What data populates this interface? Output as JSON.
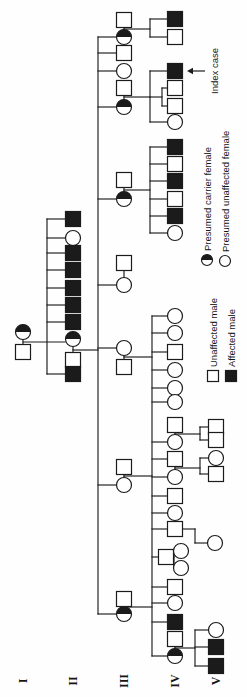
{
  "figure": {
    "type": "pedigree-chart",
    "orientation": "rotated-90-ccw",
    "canvas": {
      "width": 697,
      "height": 247
    },
    "ink_color": "#1b1b1b",
    "background_color": "#fefefe"
  },
  "generation_labels": [
    {
      "label": "I",
      "x": 16,
      "y": 23
    },
    {
      "label": "II",
      "x": 16,
      "y": 73
    },
    {
      "label": "III",
      "x": 16,
      "y": 124
    },
    {
      "label": "IV",
      "x": 16,
      "y": 175
    },
    {
      "label": "V",
      "x": 16,
      "y": 216
    }
  ],
  "legend": {
    "items": [
      {
        "symbol": "square-open",
        "label": "Unaffected male",
        "x": 321,
        "y": 213,
        "label_x": 330
      },
      {
        "symbol": "square-filled",
        "label": "Affected male",
        "x": 321,
        "y": 231,
        "label_x": 330
      },
      {
        "symbol": "circle-half",
        "label": "Presumed carrier female",
        "x": 437,
        "y": 207,
        "label_x": 446
      },
      {
        "symbol": "circle-open",
        "label": "Presumed unaffected female",
        "x": 436,
        "y": 225,
        "label_x": 445
      }
    ]
  },
  "annotations": {
    "index_case": {
      "label": "Index case",
      "arrow_x": 626,
      "arrow_from_y": 205,
      "arrow_to_y": 187,
      "label_x": 626,
      "label_y": 215
    }
  },
  "pedigree": {
    "symbol": {
      "square_size": 15,
      "circle_radius": 7.5,
      "legend_square_size": 11,
      "legend_circle_radius": 5.5
    },
    "individuals": [
      {
        "gen": "I",
        "shape": "square",
        "status": "unaffected",
        "x": 345,
        "y": 23
      },
      {
        "gen": "I",
        "shape": "circle",
        "status": "carrier",
        "x": 365,
        "y": 23
      },
      {
        "gen": "II",
        "shape": "square",
        "status": "affected",
        "x": 478,
        "y": 73
      },
      {
        "gen": "II",
        "shape": "circle",
        "status": "unaffected",
        "x": 459,
        "y": 73
      },
      {
        "gen": "II",
        "shape": "square",
        "status": "affected",
        "x": 444,
        "y": 73
      },
      {
        "gen": "II",
        "shape": "square",
        "status": "affected",
        "x": 427,
        "y": 73
      },
      {
        "gen": "II",
        "shape": "square",
        "status": "affected",
        "x": 409,
        "y": 73
      },
      {
        "gen": "II",
        "shape": "square",
        "status": "affected",
        "x": 392,
        "y": 73
      },
      {
        "gen": "II",
        "shape": "square",
        "status": "affected",
        "x": 375,
        "y": 73
      },
      {
        "gen": "II",
        "shape": "circle",
        "status": "carrier",
        "x": 358,
        "y": 73
      },
      {
        "gen": "II",
        "shape": "square",
        "status": "unaffected",
        "x": 337,
        "y": 73
      },
      {
        "gen": "II",
        "shape": "square",
        "status": "affected",
        "x": 323,
        "y": 73
      },
      {
        "gen": "III",
        "shape": "square",
        "status": "unaffected",
        "x": 677,
        "y": 124
      },
      {
        "gen": "III",
        "shape": "circle",
        "status": "carrier",
        "x": 660,
        "y": 124
      },
      {
        "gen": "III",
        "shape": "square",
        "status": "unaffected",
        "x": 644,
        "y": 124
      },
      {
        "gen": "III",
        "shape": "circle",
        "status": "unaffected",
        "x": 626,
        "y": 124
      },
      {
        "gen": "III",
        "shape": "square",
        "status": "unaffected",
        "x": 609,
        "y": 124
      },
      {
        "gen": "III",
        "shape": "circle",
        "status": "carrier",
        "x": 590,
        "y": 124
      },
      {
        "gen": "III",
        "shape": "square",
        "status": "unaffected",
        "x": 517,
        "y": 124
      },
      {
        "gen": "III",
        "shape": "circle",
        "status": "carrier",
        "x": 498,
        "y": 124
      },
      {
        "gen": "III",
        "shape": "square",
        "status": "unaffected",
        "x": 434,
        "y": 124
      },
      {
        "gen": "III",
        "shape": "circle",
        "status": "unaffected",
        "x": 412,
        "y": 124
      },
      {
        "gen": "III",
        "shape": "circle",
        "status": "unaffected",
        "x": 349,
        "y": 124
      },
      {
        "gen": "III",
        "shape": "square",
        "status": "unaffected",
        "x": 330,
        "y": 124
      },
      {
        "gen": "III",
        "shape": "square",
        "status": "unaffected",
        "x": 230,
        "y": 124
      },
      {
        "gen": "III",
        "shape": "circle",
        "status": "unaffected",
        "x": 212,
        "y": 124
      },
      {
        "gen": "III",
        "shape": "square",
        "status": "unaffected",
        "x": 98,
        "y": 124
      },
      {
        "gen": "III",
        "shape": "circle",
        "status": "carrier",
        "x": 83,
        "y": 124
      },
      {
        "gen": "IV",
        "shape": "square",
        "status": "affected",
        "x": 678,
        "y": 175
      },
      {
        "gen": "IV",
        "shape": "square",
        "status": "unaffected",
        "x": 660,
        "y": 175
      },
      {
        "gen": "IV",
        "shape": "square",
        "status": "affected",
        "x": 626,
        "y": 175,
        "note": "index case"
      },
      {
        "gen": "IV",
        "shape": "square",
        "status": "unaffected",
        "x": 609,
        "y": 175
      },
      {
        "gen": "IV",
        "shape": "square",
        "status": "unaffected",
        "x": 591,
        "y": 175
      },
      {
        "gen": "IV",
        "shape": "circle",
        "status": "unaffected",
        "x": 575,
        "y": 175
      },
      {
        "gen": "IV",
        "shape": "square",
        "status": "affected",
        "x": 550,
        "y": 175
      },
      {
        "gen": "IV",
        "shape": "square",
        "status": "unaffected",
        "x": 533,
        "y": 175
      },
      {
        "gen": "IV",
        "shape": "square",
        "status": "affected",
        "x": 516,
        "y": 175
      },
      {
        "gen": "IV",
        "shape": "square",
        "status": "unaffected",
        "x": 498,
        "y": 175
      },
      {
        "gen": "IV",
        "shape": "square",
        "status": "affected",
        "x": 481,
        "y": 175
      },
      {
        "gen": "IV",
        "shape": "circle",
        "status": "unaffected",
        "x": 464,
        "y": 175
      },
      {
        "gen": "IV",
        "shape": "circle",
        "status": "unaffected",
        "x": 381,
        "y": 175
      },
      {
        "gen": "IV",
        "shape": "circle",
        "status": "unaffected",
        "x": 364,
        "y": 175
      },
      {
        "gen": "IV",
        "shape": "square",
        "status": "unaffected",
        "x": 345,
        "y": 175
      },
      {
        "gen": "IV",
        "shape": "circle",
        "status": "unaffected",
        "x": 327,
        "y": 175
      },
      {
        "gen": "IV",
        "shape": "circle",
        "status": "unaffected",
        "x": 309,
        "y": 175
      },
      {
        "gen": "IV",
        "shape": "circle",
        "status": "unaffected",
        "x": 295,
        "y": 175
      },
      {
        "gen": "IV",
        "shape": "square",
        "status": "unaffected",
        "x": 272,
        "y": 175
      },
      {
        "gen": "IV",
        "shape": "circle",
        "status": "unaffected",
        "x": 255,
        "y": 175
      },
      {
        "gen": "IV",
        "shape": "square",
        "status": "unaffected",
        "x": 238,
        "y": 175
      },
      {
        "gen": "IV",
        "shape": "circle",
        "status": "unaffected",
        "x": 220,
        "y": 175
      },
      {
        "gen": "IV",
        "shape": "square",
        "status": "unaffected",
        "x": 201,
        "y": 175
      },
      {
        "gen": "IV",
        "shape": "circle",
        "status": "unaffected",
        "x": 184,
        "y": 175
      },
      {
        "gen": "IV",
        "shape": "square",
        "status": "unaffected",
        "x": 168,
        "y": 175
      },
      {
        "gen": "IV",
        "shape": "square",
        "status": "unaffected",
        "x": 140,
        "y": 166
      },
      {
        "gen": "IV",
        "shape": "circle",
        "status": "unaffected",
        "x": 146,
        "y": 181
      },
      {
        "gen": "IV",
        "shape": "circle",
        "status": "unaffected",
        "x": 129,
        "y": 181
      },
      {
        "gen": "IV",
        "shape": "square",
        "status": "unaffected",
        "x": 110,
        "y": 175
      },
      {
        "gen": "IV",
        "shape": "circle",
        "status": "unaffected",
        "x": 94,
        "y": 175
      },
      {
        "gen": "IV",
        "shape": "square",
        "status": "affected",
        "x": 75,
        "y": 175
      },
      {
        "gen": "IV",
        "shape": "square",
        "status": "unaffected",
        "x": 58,
        "y": 175
      },
      {
        "gen": "IV",
        "shape": "circle",
        "status": "carrier",
        "x": 41,
        "y": 175
      },
      {
        "gen": "V",
        "shape": "square",
        "status": "unaffected",
        "x": 270,
        "y": 216
      },
      {
        "gen": "V",
        "shape": "square",
        "status": "unaffected",
        "x": 257,
        "y": 216
      },
      {
        "gen": "V",
        "shape": "circle",
        "status": "unaffected",
        "x": 239,
        "y": 216
      },
      {
        "gen": "V",
        "shape": "square",
        "status": "unaffected",
        "x": 223,
        "y": 216
      },
      {
        "gen": "V",
        "shape": "circle",
        "status": "unaffected",
        "x": 154,
        "y": 215
      },
      {
        "gen": "V",
        "shape": "circle",
        "status": "unaffected",
        "x": 67,
        "y": 216
      },
      {
        "gen": "V",
        "shape": "square",
        "status": "affected",
        "x": 50,
        "y": 216
      },
      {
        "gen": "V",
        "shape": "square",
        "status": "affected",
        "x": 31,
        "y": 216
      }
    ],
    "lines": [
      [
        345,
        23,
        365,
        23
      ],
      [
        337,
        73,
        358,
        73
      ],
      [
        660,
        124,
        677,
        124
      ],
      [
        590,
        124,
        609,
        124
      ],
      [
        498,
        124,
        517,
        124
      ],
      [
        412,
        124,
        434,
        124
      ],
      [
        330,
        124,
        349,
        124
      ],
      [
        212,
        124,
        230,
        124
      ],
      [
        83,
        124,
        98,
        124
      ],
      [
        255,
        175,
        272,
        175
      ],
      [
        220,
        175,
        238,
        175
      ],
      [
        41,
        175,
        58,
        175
      ],
      [
        355,
        23,
        355,
        65
      ],
      [
        347,
        73,
        347,
        98
      ],
      [
        668,
        124,
        668,
        150
      ],
      [
        600,
        124,
        600,
        150
      ],
      [
        507,
        124,
        507,
        150
      ],
      [
        340,
        124,
        340,
        152
      ],
      [
        221,
        124,
        221,
        152
      ],
      [
        90,
        124,
        90,
        152
      ],
      [
        263,
        175,
        263,
        200
      ],
      [
        229,
        175,
        229,
        200
      ],
      [
        168,
        175,
        168,
        195
      ],
      [
        49,
        175,
        49,
        195
      ],
      [
        140,
        166,
        140,
        174
      ],
      [
        600,
        150,
        600,
        162
      ],
      [
        323,
        47,
        478,
        47
      ],
      [
        83,
        98,
        660,
        98
      ],
      [
        660,
        150,
        678,
        150
      ],
      [
        575,
        150,
        626,
        150
      ],
      [
        591,
        162,
        609,
        162
      ],
      [
        464,
        150,
        550,
        150
      ],
      [
        41,
        152,
        381,
        152
      ],
      [
        257,
        200,
        270,
        200
      ],
      [
        223,
        200,
        239,
        200
      ],
      [
        154,
        195,
        168,
        195
      ],
      [
        31,
        195,
        67,
        195
      ],
      [
        129,
        174,
        146,
        174
      ],
      [
        478,
        47,
        478,
        73
      ],
      [
        459,
        47,
        459,
        73
      ],
      [
        444,
        47,
        444,
        73
      ],
      [
        427,
        47,
        427,
        73
      ],
      [
        409,
        47,
        409,
        73
      ],
      [
        392,
        47,
        392,
        73
      ],
      [
        375,
        47,
        375,
        73
      ],
      [
        323,
        47,
        323,
        73
      ],
      [
        660,
        98,
        660,
        124
      ],
      [
        644,
        98,
        644,
        124
      ],
      [
        626,
        98,
        626,
        124
      ],
      [
        590,
        98,
        590,
        124
      ],
      [
        498,
        98,
        498,
        124
      ],
      [
        412,
        98,
        412,
        124
      ],
      [
        349,
        98,
        349,
        124
      ],
      [
        212,
        98,
        212,
        124
      ],
      [
        83,
        98,
        83,
        124
      ],
      [
        660,
        150,
        660,
        175
      ],
      [
        678,
        150,
        678,
        175
      ],
      [
        626,
        150,
        626,
        175
      ],
      [
        575,
        150,
        575,
        175
      ],
      [
        591,
        162,
        591,
        175
      ],
      [
        609,
        162,
        609,
        175
      ],
      [
        550,
        150,
        550,
        175
      ],
      [
        533,
        150,
        533,
        175
      ],
      [
        516,
        150,
        516,
        175
      ],
      [
        498,
        150,
        498,
        175
      ],
      [
        481,
        150,
        481,
        175
      ],
      [
        464,
        150,
        464,
        175
      ],
      [
        381,
        152,
        381,
        175
      ],
      [
        364,
        152,
        364,
        175
      ],
      [
        345,
        152,
        345,
        175
      ],
      [
        327,
        152,
        327,
        175
      ],
      [
        309,
        152,
        309,
        175
      ],
      [
        295,
        152,
        295,
        175
      ],
      [
        255,
        152,
        255,
        175
      ],
      [
        238,
        152,
        238,
        175
      ],
      [
        220,
        152,
        220,
        175
      ],
      [
        201,
        152,
        201,
        175
      ],
      [
        184,
        152,
        184,
        175
      ],
      [
        168,
        152,
        168,
        175
      ],
      [
        140,
        152,
        140,
        166
      ],
      [
        110,
        152,
        110,
        175
      ],
      [
        94,
        152,
        94,
        175
      ],
      [
        75,
        152,
        75,
        175
      ],
      [
        41,
        152,
        41,
        175
      ],
      [
        257,
        200,
        257,
        216
      ],
      [
        270,
        200,
        270,
        216
      ],
      [
        223,
        200,
        223,
        216
      ],
      [
        239,
        200,
        239,
        216
      ],
      [
        154,
        195,
        154,
        215
      ],
      [
        31,
        195,
        31,
        216
      ],
      [
        50,
        195,
        50,
        216
      ],
      [
        67,
        195,
        67,
        216
      ],
      [
        129,
        174,
        129,
        181
      ],
      [
        146,
        174,
        146,
        181
      ]
    ]
  }
}
